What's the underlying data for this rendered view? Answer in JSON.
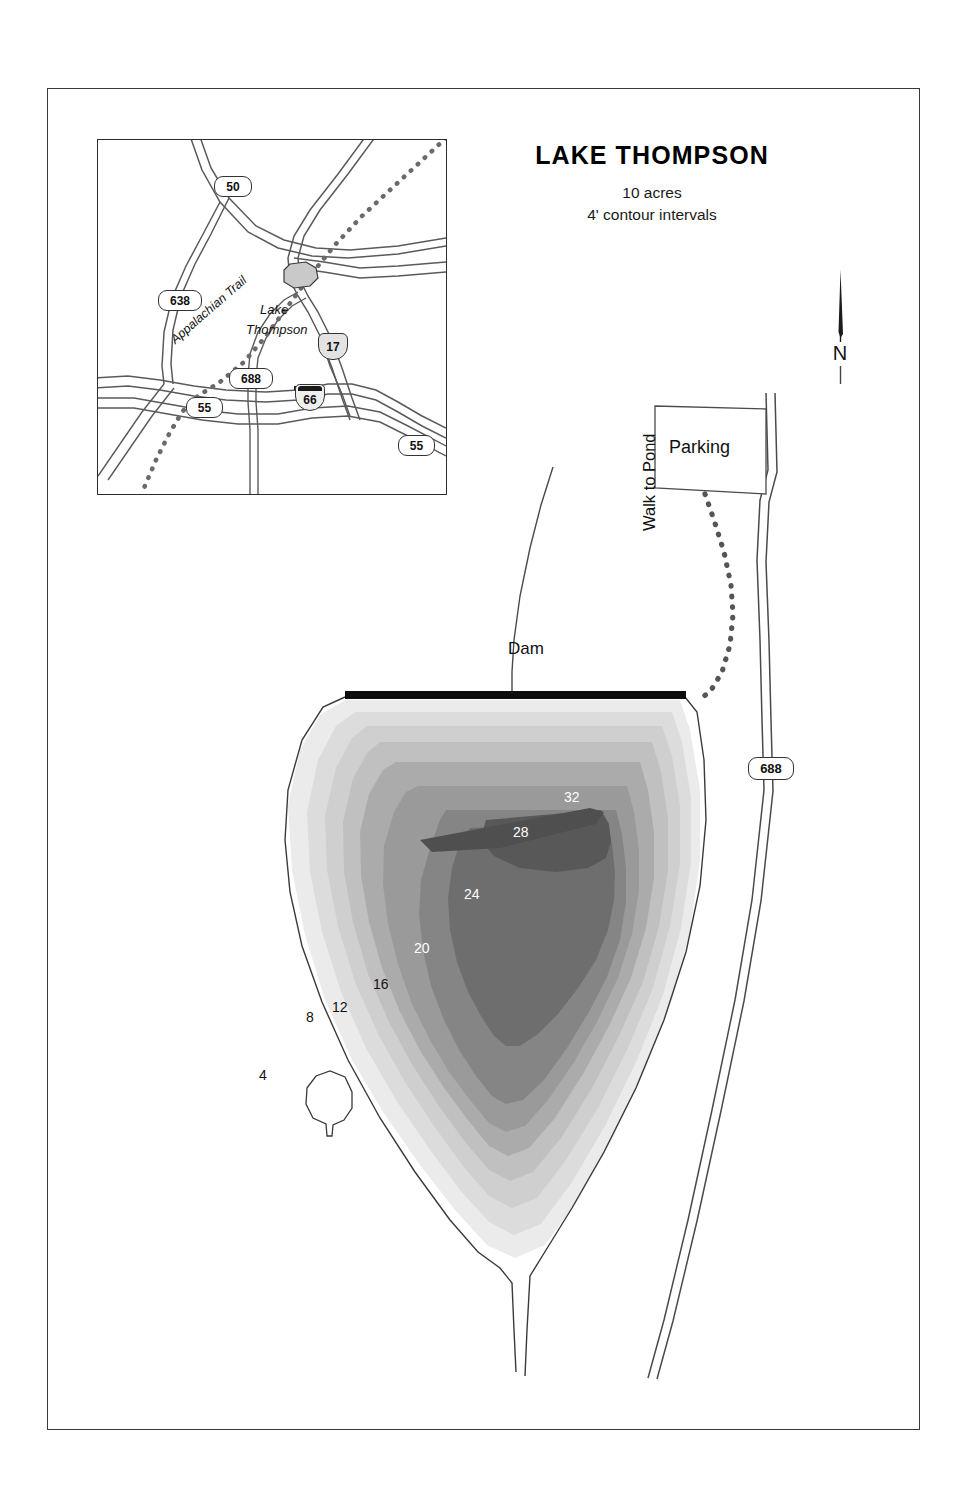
{
  "title": {
    "name": "LAKE THOMPSON",
    "acreage": "10 acres",
    "contour_note": "4' contour intervals"
  },
  "compass": {
    "label": "N",
    "icon": "north-arrow-icon"
  },
  "main_map": {
    "labels": {
      "dam": "Dam",
      "parking": "Parking",
      "trail": "Walk to Pond"
    },
    "route_shield": "688",
    "contour_labels": [
      {
        "value": "4",
        "x": 259,
        "y": 1067,
        "style": "dark"
      },
      {
        "value": "8",
        "x": 306,
        "y": 1009,
        "style": "dark"
      },
      {
        "value": "12",
        "x": 332,
        "y": 999,
        "style": "dark"
      },
      {
        "value": "16",
        "x": 373,
        "y": 976,
        "style": "dark"
      },
      {
        "value": "20",
        "x": 414,
        "y": 940,
        "style": "light"
      },
      {
        "value": "24",
        "x": 464,
        "y": 886,
        "style": "light"
      },
      {
        "value": "28",
        "x": 513,
        "y": 824,
        "style": "light"
      },
      {
        "value": "32",
        "x": 564,
        "y": 789,
        "style": "light"
      }
    ],
    "depth_bands": [
      {
        "depth": "0-4",
        "color": "#ebebeb"
      },
      {
        "depth": "4-8",
        "color": "#dcdcdc"
      },
      {
        "depth": "8-12",
        "color": "#cfcfcf"
      },
      {
        "depth": "12-16",
        "color": "#c0c0c0"
      },
      {
        "depth": "16-20",
        "color": "#ababab"
      },
      {
        "depth": "20-24",
        "color": "#9a9a9a"
      },
      {
        "depth": "24-28",
        "color": "#858585"
      },
      {
        "depth": "28-32",
        "color": "#6e6e6e"
      },
      {
        "depth": "32+",
        "color": "#585858"
      }
    ]
  },
  "inset_map": {
    "lake_label_line1": "Lake",
    "lake_label_line2": "Thompson",
    "trail_label": "Appalachian Trail",
    "shields": [
      {
        "number": "50",
        "type": "state"
      },
      {
        "number": "638",
        "type": "state"
      },
      {
        "number": "688",
        "type": "state"
      },
      {
        "number": "55",
        "type": "state"
      },
      {
        "number": "55",
        "type": "state"
      },
      {
        "number": "17",
        "type": "us"
      },
      {
        "number": "66",
        "type": "interstate"
      }
    ]
  }
}
